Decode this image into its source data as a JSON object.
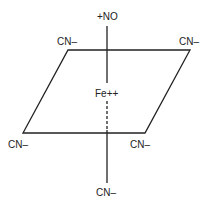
{
  "diagram": {
    "center": {
      "label": "Fe++"
    },
    "axial_top": {
      "label": "+NO"
    },
    "axial_bottom": {
      "label": "CN–"
    },
    "equatorial": [
      {
        "label": "CN–",
        "position": "top-left"
      },
      {
        "label": "CN–",
        "position": "top-right"
      },
      {
        "label": "CN–",
        "position": "bottom-left"
      },
      {
        "label": "CN–",
        "position": "bottom-right"
      }
    ],
    "colors": {
      "line": "#222222",
      "background": "#ffffff"
    }
  }
}
